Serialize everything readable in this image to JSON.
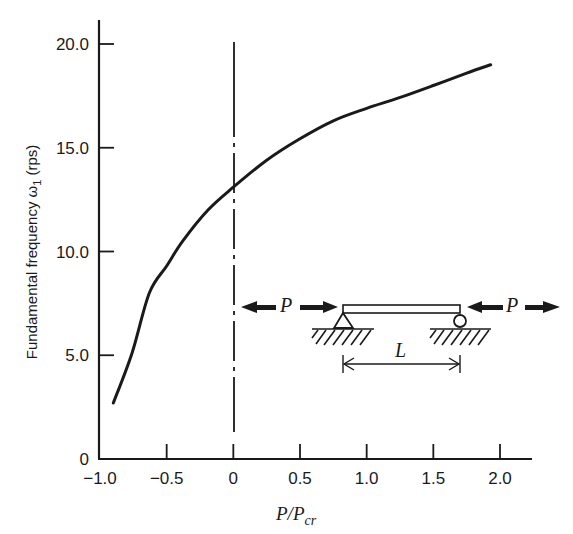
{
  "chart_data": {
    "type": "line",
    "title": "",
    "xlabel": "P/P_cr",
    "xlabel_main": "P/P",
    "xlabel_sub": "cr",
    "ylabel": "Fundamental frequency ω1 (rps)",
    "ylabel_main": "Fundamental frequency ω",
    "ylabel_sub": "1",
    "ylabel_units": "(rps)",
    "xlim": [
      -1.0,
      2.2
    ],
    "ylim": [
      0,
      21
    ],
    "grid": false,
    "x_ticks": [
      -1.0,
      -0.5,
      0,
      0.5,
      1.0,
      1.5,
      2.0
    ],
    "x_tick_labels": [
      "−1.0",
      "−0.5",
      "0",
      "0.5",
      "1.0",
      "1.5",
      "2.0"
    ],
    "y_ticks": [
      0,
      5.0,
      10.0,
      15.0,
      20.0
    ],
    "y_tick_labels": [
      "0",
      "5.0",
      "10.0",
      "15.0",
      "20.0"
    ],
    "series": [
      {
        "name": "ω1 vs P/Pcr",
        "x": [
          -0.9,
          -0.76,
          -0.63,
          -0.5,
          -0.38,
          -0.19,
          0.0,
          0.25,
          0.49,
          0.75,
          1.0,
          1.24,
          1.5,
          1.75,
          1.93
        ],
        "y": [
          2.7,
          5.1,
          8.0,
          9.3,
          10.5,
          12.0,
          13.1,
          14.4,
          15.4,
          16.3,
          16.9,
          17.4,
          18.0,
          18.6,
          19.0
        ]
      }
    ],
    "reference_lines": [
      {
        "type": "vertical",
        "x": 0,
        "style": "dash-dot"
      }
    ],
    "annotations": {
      "diagram": "Simply supported beam of span L with axial load P at each end (pin support left, roller right)",
      "force_label_left": "P",
      "force_label_right": "P",
      "span_label": "L"
    }
  }
}
